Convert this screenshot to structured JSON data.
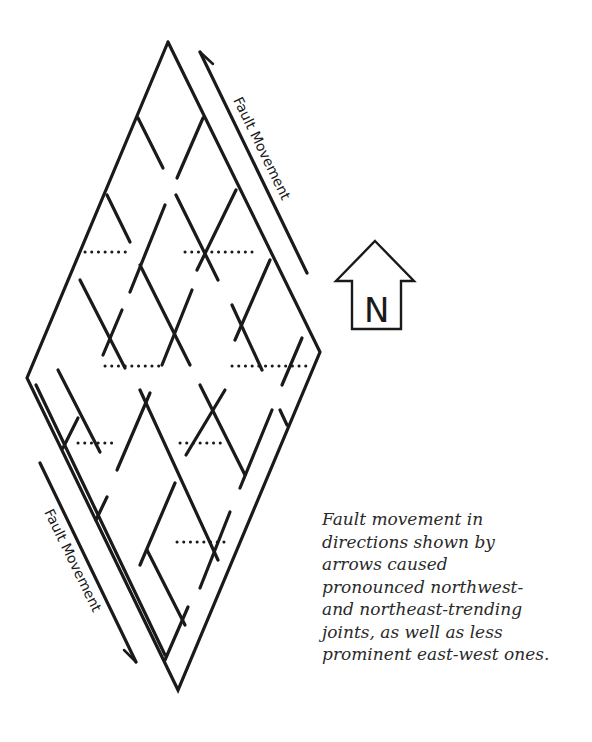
{
  "diagram": {
    "labels": {
      "fault_movement_top": "Fault Movement",
      "fault_movement_bottom": "Fault Movement",
      "north": "N"
    },
    "colors": {
      "stroke": "#1a1a1a",
      "background": "#ffffff",
      "text": "#2a2a2a"
    }
  },
  "caption": {
    "lines": [
      "Fault movement in",
      "directions shown by",
      "arrows caused",
      "pronounced northwest-",
      "and northeast-trending",
      "joints, as well as less",
      "prominent east-west ones."
    ]
  }
}
